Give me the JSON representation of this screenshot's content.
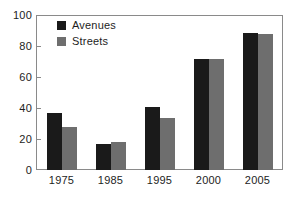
{
  "chart_data": {
    "type": "bar",
    "title": "",
    "xlabel": "",
    "ylabel": "",
    "categories": [
      "1975",
      "1985",
      "1995",
      "2000",
      "2005"
    ],
    "series": [
      {
        "name": "Avenues",
        "color": "#1a1a1a",
        "values": [
          37,
          17,
          41,
          72,
          89
        ]
      },
      {
        "name": "Streets",
        "color": "#6e6e6e",
        "values": [
          28,
          18,
          34,
          72,
          88
        ]
      }
    ],
    "ylim": [
      0,
      100
    ],
    "yticks": [
      "0",
      "20",
      "40",
      "60",
      "80",
      "100"
    ],
    "grid": false,
    "legend_position": "top-left",
    "frame_color": "#8a8a8a",
    "background": "#ffffff"
  }
}
